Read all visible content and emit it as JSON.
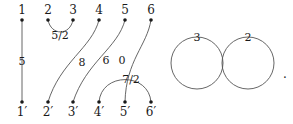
{
  "figure": {
    "width": 293,
    "height": 124,
    "background_color": "#ffffff",
    "stroke_color": "#555555",
    "text_color": "#1a1a1a",
    "dot_color": "#1a1a1a",
    "trailing_punctuation": "."
  },
  "top_nodes": [
    {
      "label": "1",
      "x": 22,
      "y": 20
    },
    {
      "label": "2",
      "x": 48,
      "y": 20
    },
    {
      "label": "3",
      "x": 73,
      "y": 20
    },
    {
      "label": "4",
      "x": 99,
      "y": 20
    },
    {
      "label": "5",
      "x": 125,
      "y": 20
    },
    {
      "label": "6",
      "x": 151,
      "y": 20
    }
  ],
  "bottom_nodes": [
    {
      "label": "1′",
      "x": 22,
      "y": 102
    },
    {
      "label": "2′",
      "x": 48,
      "y": 102
    },
    {
      "label": "3′",
      "x": 73,
      "y": 102
    },
    {
      "label": "4′",
      "x": 99,
      "y": 102
    },
    {
      "label": "5′",
      "x": 125,
      "y": 102
    },
    {
      "label": "6′",
      "x": 151,
      "y": 102
    }
  ],
  "strands": [
    {
      "name": "strand-1-to-1prime",
      "from": "1",
      "to": "1′",
      "label": "5",
      "label_x": 22,
      "label_y": 61,
      "path": "M 22 20 L 22 102"
    },
    {
      "name": "arc-2-to-3",
      "from": "2",
      "to": "3",
      "label": "5/2",
      "label_x": 60,
      "label_y": 35,
      "path": "M 48 20 C 51 36, 70 36, 73 20"
    },
    {
      "name": "strand-4-to-2prime",
      "from": "4",
      "to": "2′",
      "label": "8",
      "label_x": 82,
      "label_y": 62,
      "path": "M 99 20 C 92 48, 60 62, 48 102"
    },
    {
      "name": "strand-5-to-3prime",
      "from": "5",
      "to": "3′",
      "label": "6",
      "label_x": 106,
      "label_y": 60,
      "path": "M 125 20 C 118 48, 86 62, 73 102"
    },
    {
      "name": "strand-6-to-5prime",
      "from": "6",
      "to": "5′",
      "label": "0",
      "label_x": 122,
      "label_y": 60,
      "path": "M 151 20 C 147 46, 126 60, 125 102"
    },
    {
      "name": "arc-4prime-to-6prime",
      "from": "4′",
      "to": "6′",
      "label": "7/2",
      "label_x": 131,
      "label_y": 79,
      "path": "M 99 102 C 101 72, 149 72, 151 102"
    }
  ],
  "loops": [
    {
      "name": "loop-left",
      "label": "3",
      "cx": 197,
      "cy": 63,
      "r": 26,
      "label_x": 197,
      "label_y": 37
    },
    {
      "name": "loop-right",
      "label": "2",
      "cx": 248,
      "cy": 63,
      "r": 26,
      "label_x": 248,
      "label_y": 37
    }
  ],
  "punctuation": {
    "text": ".",
    "x": 285,
    "y": 74
  }
}
